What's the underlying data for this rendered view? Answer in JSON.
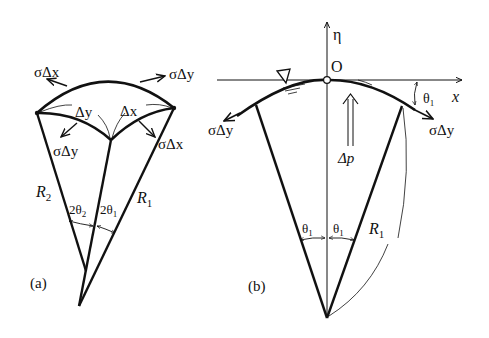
{
  "panel_a": {
    "label": "(a)",
    "force_top_left": "σΔx",
    "force_top_right": "σΔy",
    "inner_left_length": "Δy",
    "inner_right_length": "Δx",
    "force_inner_left": "σΔy",
    "force_inner_right": "σΔx",
    "radius_left": "R",
    "radius_left_sub": "2",
    "radius_right": "R",
    "radius_right_sub": "1",
    "angle_left": "2θ",
    "angle_left_sub": "2",
    "angle_right": "2θ",
    "angle_right_sub": "1"
  },
  "panel_b": {
    "label": "(b)",
    "axis_vertical": "η",
    "axis_horizontal": "x",
    "origin": "O",
    "force_left": "σΔy",
    "force_right": "σΔy",
    "pressure": "Δp",
    "tilt_angle": "θ",
    "tilt_angle_sub": "1",
    "half_angle_left": "θ",
    "half_angle_left_sub": "1",
    "half_angle_right": "θ",
    "half_angle_right_sub": "1",
    "radius": "R",
    "radius_sub": "1"
  },
  "colors": {
    "ink": "#111111",
    "background": "#ffffff"
  }
}
